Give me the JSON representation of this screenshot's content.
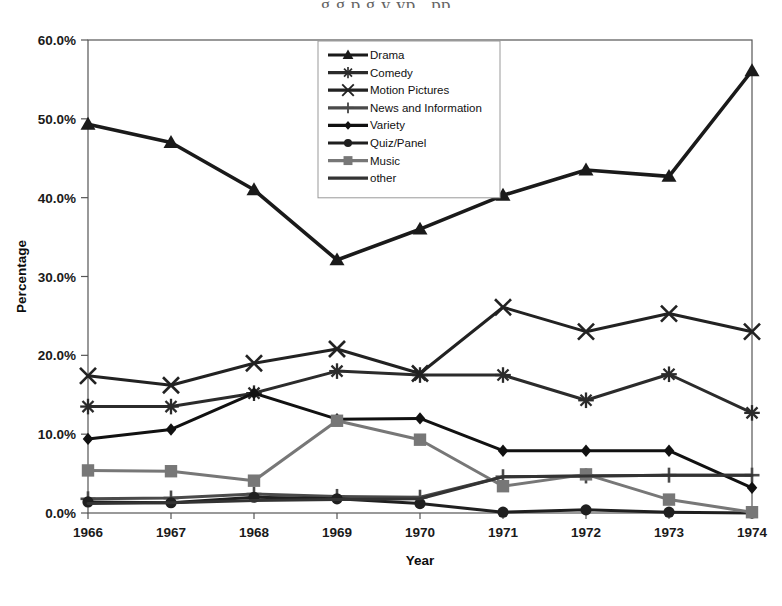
{
  "page": {
    "bleed_text_top": "g       g      p      g  y yp ,     pp     ,"
  },
  "axis": {
    "y_title": "Percentage",
    "x_title": "Year",
    "y_ticks": [
      "0.0%",
      "10.0%",
      "20.0%",
      "30.0%",
      "40.0%",
      "50.0%",
      "60.0%"
    ],
    "x_ticks": [
      "1966",
      "1967",
      "1968",
      "1969",
      "1970",
      "1971",
      "1972",
      "1973",
      "1974"
    ]
  },
  "legend": {
    "position": "top-center-inside",
    "entries": [
      {
        "label": "Drama",
        "marker": "triangle",
        "color": "#1a1a1a"
      },
      {
        "label": "Comedy",
        "marker": "asterisk",
        "color": "#2b2b2b"
      },
      {
        "label": "Motion Pictures",
        "marker": "x",
        "color": "#222222"
      },
      {
        "label": "News and Information",
        "marker": "plus",
        "color": "#4a4a4a"
      },
      {
        "label": "Variety",
        "marker": "diamond",
        "color": "#111111"
      },
      {
        "label": "Quiz/Panel",
        "marker": "circle",
        "color": "#1f1f1f"
      },
      {
        "label": "Music",
        "marker": "square",
        "color": "#777777"
      },
      {
        "label": "other",
        "marker": "none",
        "color": "#333333"
      }
    ]
  },
  "chart_data": {
    "type": "line",
    "title": "",
    "xlabel": "Year",
    "ylabel": "Percentage",
    "categories": [
      "1966",
      "1967",
      "1968",
      "1969",
      "1970",
      "1971",
      "1972",
      "1973",
      "1974"
    ],
    "ylim": [
      0,
      60
    ],
    "ytick_step": 10,
    "yunit": "%",
    "grid": false,
    "legend": "inside top center",
    "series": [
      {
        "name": "Drama",
        "marker": "triangle",
        "color": "#1a1a1a",
        "values": [
          49.3,
          47.0,
          41.0,
          32.1,
          36.0,
          40.3,
          43.5,
          42.7,
          56.1
        ]
      },
      {
        "name": "Comedy",
        "marker": "asterisk",
        "color": "#2b2b2b",
        "values": [
          13.5,
          13.5,
          15.2,
          18.0,
          17.5,
          17.5,
          14.3,
          17.6,
          12.7
        ]
      },
      {
        "name": "Motion Pictures",
        "marker": "x",
        "color": "#222222",
        "values": [
          17.4,
          16.2,
          19.0,
          20.8,
          17.7,
          26.1,
          23.0,
          25.3,
          23.0
        ]
      },
      {
        "name": "News and Information",
        "marker": "plus",
        "color": "#4a4a4a",
        "values": [
          1.8,
          1.9,
          2.4,
          2.1,
          2.0,
          4.6,
          4.7,
          4.8,
          4.8
        ]
      },
      {
        "name": "Variety",
        "marker": "diamond",
        "color": "#111111",
        "values": [
          9.4,
          10.6,
          15.2,
          11.9,
          12.0,
          7.9,
          7.9,
          7.9,
          3.2
        ]
      },
      {
        "name": "Quiz/Panel",
        "marker": "circle",
        "color": "#1f1f1f",
        "values": [
          1.4,
          1.3,
          2.0,
          1.8,
          1.2,
          0.1,
          0.4,
          0.1,
          0.0
        ]
      },
      {
        "name": "Music",
        "marker": "square",
        "color": "#777777",
        "values": [
          5.4,
          5.3,
          4.1,
          11.7,
          9.3,
          3.4,
          4.9,
          1.7,
          0.1
        ]
      },
      {
        "name": "other",
        "marker": "none",
        "color": "#333333",
        "values": [
          1.2,
          1.3,
          1.6,
          1.7,
          1.8,
          4.6,
          4.7,
          4.8,
          4.8
        ]
      }
    ]
  }
}
